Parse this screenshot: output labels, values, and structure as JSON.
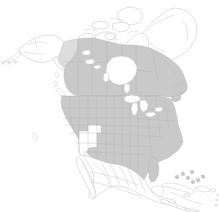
{
  "figure": {
    "title": "North America regional highlight map",
    "description": "Outline map of North America with the contiguous United States and Canada filled in light grey; Alaska, Greenland, Mexico, Central America and the Caribbean are left unfilled white.",
    "width_px": 219,
    "height_px": 212,
    "background_color": "#ffffff"
  },
  "legend": {
    "visible": false,
    "entries": [
      {
        "key": "highlighted",
        "label": "Highlighted region",
        "color": "#c9c9c9"
      },
      {
        "key": "partial",
        "label": "Partially highlighted region",
        "color": "#dddddd"
      },
      {
        "key": "unhighlighted",
        "label": "Other land",
        "color": "#ffffff"
      },
      {
        "key": "water",
        "label": "Water",
        "color": "#ffffff"
      }
    ]
  },
  "map_style": {
    "land_fill_highlight": "#c9c9c9",
    "land_fill_partial": "#dddddd",
    "land_fill_plain": "#ffffff",
    "border_stroke": "#b5b5b5",
    "subdivision_stroke": "#b0b0b0",
    "water_fill": "#ffffff"
  },
  "regions": [
    {
      "id": "united-states-contiguous",
      "name": "Contiguous United States",
      "highlighted": true,
      "fill": "#c9c9c9",
      "has_subdivisions": true,
      "subdivision_type": "states"
    },
    {
      "id": "canada",
      "name": "Canada",
      "highlighted": true,
      "fill": "#c9c9c9",
      "has_subdivisions": true,
      "subdivision_type": "provinces and territories"
    },
    {
      "id": "yukon",
      "name": "Yukon",
      "highlighted": true,
      "fill": "#dddddd",
      "has_subdivisions": false,
      "subdivision_type": "territory"
    },
    {
      "id": "alaska",
      "name": "Alaska",
      "highlighted": false,
      "fill": "#ffffff",
      "has_subdivisions": false,
      "subdivision_type": "state"
    },
    {
      "id": "utah-nevada-gap",
      "name": "Unhighlighted interior states",
      "highlighted": false,
      "fill": "#ffffff",
      "has_subdivisions": true,
      "subdivision_type": "states"
    },
    {
      "id": "greenland",
      "name": "Greenland",
      "highlighted": false,
      "fill": "#ffffff",
      "has_subdivisions": false,
      "subdivision_type": "country"
    },
    {
      "id": "canadian-arctic-archipelago",
      "name": "Canadian Arctic Archipelago",
      "highlighted": false,
      "fill": "#ffffff",
      "has_subdivisions": true,
      "subdivision_type": "islands"
    },
    {
      "id": "mexico",
      "name": "Mexico",
      "highlighted": false,
      "fill": "#ffffff",
      "has_subdivisions": true,
      "subdivision_type": "states"
    },
    {
      "id": "central-america",
      "name": "Central America",
      "highlighted": false,
      "fill": "#ffffff",
      "has_subdivisions": true,
      "subdivision_type": "countries"
    },
    {
      "id": "caribbean",
      "name": "Caribbean islands",
      "highlighted": false,
      "fill": "#ffffff",
      "has_subdivisions": true,
      "subdivision_type": "islands"
    }
  ],
  "water_bodies": [
    {
      "id": "hudson-bay",
      "name": "Hudson Bay"
    },
    {
      "id": "great-lakes",
      "name": "Great Lakes"
    },
    {
      "id": "great-slave-lake",
      "name": "Great Slave Lake"
    },
    {
      "id": "great-bear-lake",
      "name": "Great Bear Lake"
    },
    {
      "id": "lake-winnipeg",
      "name": "Lake Winnipeg"
    },
    {
      "id": "gulf-of-mexico",
      "name": "Gulf of Mexico"
    },
    {
      "id": "baffin-bay",
      "name": "Baffin Bay"
    }
  ]
}
